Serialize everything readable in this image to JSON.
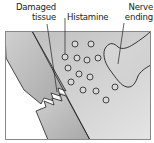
{
  "labels": {
    "damaged_tissue": [
      "Damaged",
      "tissue"
    ],
    "histamine": "Histamine",
    "nerve_ending": [
      "Nerve",
      "ending"
    ]
  },
  "colors": {
    "background": "#ffffff",
    "tissue_fill": "#c4c4c4",
    "tissue_light": "#e2e2e2",
    "outline": "#222222",
    "histamine_fill": "#d6d6d6"
  }
}
